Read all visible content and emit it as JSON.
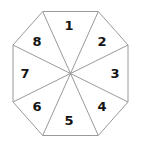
{
  "figure": {
    "name": "numbered-octagon",
    "title": "",
    "background_color": "#ffffff",
    "stroke_color": "#9a9a9a",
    "stroke_width": 1,
    "label_color": "#141414",
    "label_font_size": 13,
    "label_font_weight": "bold"
  },
  "chart_data": {
    "type": "pie",
    "title": "",
    "subtitle": "",
    "xlabel": "",
    "ylabel": "",
    "grid": false,
    "legend": "none",
    "shape": "regular-octagon",
    "sector_count": 8,
    "slice_angle_degrees": 45,
    "values": [
      1,
      1,
      1,
      1,
      1,
      1,
      1,
      1
    ],
    "categories": [
      "1",
      "2",
      "3",
      "4",
      "5",
      "6",
      "7",
      "8"
    ],
    "labels": [
      "1",
      "2",
      "3",
      "4",
      "5",
      "6",
      "7",
      "8"
    ],
    "ordering": "clockwise-from-top",
    "center": {
      "x": 70.5,
      "y": 73.5
    },
    "circumradius": 61,
    "bounds": {
      "left": 12,
      "top": 11,
      "right": 129,
      "bottom": 136
    },
    "octagon_vertices": [
      {
        "x": 42.7,
        "y": 11.5
      },
      {
        "x": 98.3,
        "y": 11.5
      },
      {
        "x": 128.0,
        "y": 45.0
      },
      {
        "x": 128.0,
        "y": 102.0
      },
      {
        "x": 98.3,
        "y": 135.5
      },
      {
        "x": 42.7,
        "y": 135.5
      },
      {
        "x": 13.0,
        "y": 102.0
      },
      {
        "x": 13.0,
        "y": 45.0
      }
    ],
    "sectors": [
      {
        "id": "sector-1",
        "label": "1",
        "label_x": 69,
        "label_y": 25
      },
      {
        "id": "sector-2",
        "label": "2",
        "label_x": 102,
        "label_y": 41
      },
      {
        "id": "sector-3",
        "label": "3",
        "label_x": 115,
        "label_y": 73
      },
      {
        "id": "sector-4",
        "label": "4",
        "label_x": 102,
        "label_y": 106
      },
      {
        "id": "sector-5",
        "label": "5",
        "label_x": 69,
        "label_y": 120
      },
      {
        "id": "sector-6",
        "label": "6",
        "label_x": 37,
        "label_y": 106
      },
      {
        "id": "sector-7",
        "label": "7",
        "label_x": 25,
        "label_y": 73
      },
      {
        "id": "sector-8",
        "label": "8",
        "label_x": 37,
        "label_y": 41
      }
    ]
  }
}
